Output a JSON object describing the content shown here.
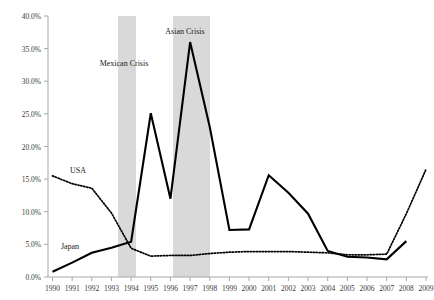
{
  "chart_data": {
    "type": "line",
    "title": "",
    "xlabel": "",
    "ylabel": "",
    "grid": false,
    "legend_position": "inline-labels",
    "ylim": [
      0,
      40
    ],
    "ytick_labels": [
      "0.0%",
      "5.0%",
      "10.0%",
      "15.0%",
      "20.0%",
      "25.0%",
      "30.0%",
      "35.0%",
      "40.0%"
    ],
    "ytick_values": [
      0,
      5,
      10,
      15,
      20,
      25,
      30,
      35,
      40
    ],
    "categories": [
      "1990",
      "1991",
      "1992",
      "1993",
      "1994",
      "1995",
      "1996",
      "1997",
      "1998",
      "1999",
      "2000",
      "2001",
      "2002",
      "2003",
      "2004",
      "2005",
      "2006",
      "2007",
      "2008",
      "2009"
    ],
    "series": [
      {
        "name": "Japan",
        "style": "solid",
        "color": "#000000",
        "values": [
          0.8,
          2.2,
          3.7,
          4.5,
          5.4,
          25.1,
          12.0,
          36.0,
          23.0,
          7.2,
          7.3,
          15.6,
          12.9,
          9.7,
          4.0,
          3.1,
          3.0,
          2.7,
          5.5,
          null
        ]
      },
      {
        "name": "USA",
        "style": "dotted",
        "color": "#000000",
        "values": [
          15.5,
          14.3,
          13.6,
          9.8,
          4.4,
          3.2,
          3.3,
          3.3,
          3.6,
          3.8,
          3.9,
          3.9,
          3.9,
          3.8,
          3.7,
          3.4,
          3.4,
          3.5,
          9.7,
          16.5
        ]
      }
    ],
    "shaded_bands": [
      {
        "label": "Mexican Crisis",
        "start": "1993.5",
        "end": "1994.5",
        "color": "#d9d9d9"
      },
      {
        "label": "Asian Crisis",
        "start": "1996.5",
        "end": "1998.5",
        "color": "#d9d9d9"
      }
    ],
    "annotations": [
      {
        "text": "Mexican Crisis",
        "x": 124,
        "y": 66
      },
      {
        "text": "Asian Crisis",
        "x": 185,
        "y": 34
      },
      {
        "text": "USA",
        "x": 78,
        "y": 173
      },
      {
        "text": "Japan",
        "x": 70,
        "y": 249
      }
    ],
    "axis_color": "#9a9a9a"
  }
}
